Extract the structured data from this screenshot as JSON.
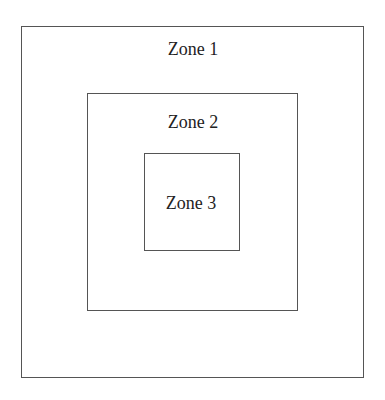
{
  "diagram": {
    "zones": [
      {
        "label": "Zone 1"
      },
      {
        "label": "Zone 2"
      },
      {
        "label": "Zone 3"
      }
    ]
  },
  "colors": {
    "border": "#555555",
    "text": "#222222",
    "background": "#ffffff"
  }
}
